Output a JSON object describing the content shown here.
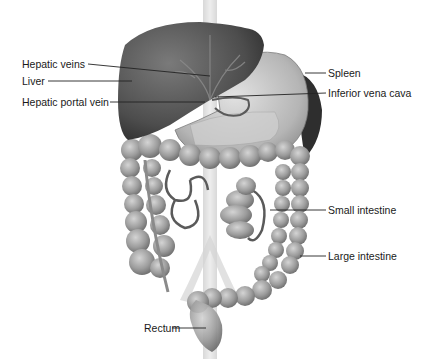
{
  "diagram": {
    "type": "anatomical-illustration",
    "labels": [
      {
        "id": "hepatic-veins",
        "text": "Hepatic veins",
        "side": "left"
      },
      {
        "id": "liver",
        "text": "Liver",
        "side": "left"
      },
      {
        "id": "hepatic-portal-vein",
        "text": "Hepatic portal vein",
        "side": "left"
      },
      {
        "id": "spleen",
        "text": "Spleen",
        "side": "right"
      },
      {
        "id": "inferior-vena-cava",
        "text": "Inferior vena cava",
        "side": "right"
      },
      {
        "id": "small-intestine",
        "text": "Small intestine",
        "side": "right"
      },
      {
        "id": "large-intestine",
        "text": "Large intestine",
        "side": "right"
      },
      {
        "id": "rectum",
        "text": "Rectum",
        "side": "left"
      }
    ],
    "colors": {
      "background": "#ffffff",
      "liver": "#5a5a5a",
      "stomach": "#b8b8b8",
      "intestine": "#9a9a9a",
      "spleen": "#3a3a3a",
      "leader_line": "#222222"
    }
  }
}
